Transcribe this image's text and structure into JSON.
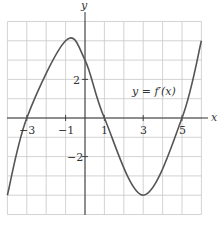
{
  "chart_data": {
    "type": "line",
    "title": "",
    "xlabel": "x",
    "ylabel": "y",
    "xlim": [
      -4,
      6
    ],
    "ylim": [
      -5,
      5
    ],
    "grid": true,
    "x_ticks": [
      -3,
      -1,
      1,
      3,
      5
    ],
    "x_tick_labels": [
      "−3",
      "−1",
      "1",
      "3",
      "5"
    ],
    "y_ticks": [
      2,
      -2
    ],
    "y_tick_labels": [
      "2",
      "−2"
    ],
    "series": [
      {
        "name": "y = f′(x)",
        "points": [
          [
            -4,
            -4
          ],
          [
            -3,
            0
          ],
          [
            -1,
            4
          ],
          [
            0,
            3
          ],
          [
            1,
            0
          ],
          [
            3,
            -4
          ],
          [
            5,
            0
          ],
          [
            6,
            4
          ]
        ]
      }
    ],
    "annotations": [
      {
        "text": "y = f′(x)",
        "x": 2.5,
        "y": 1.35
      }
    ]
  },
  "labels": {
    "x_axis": "x",
    "y_axis": "y",
    "curve_label": "y = f′(x)",
    "xt0": "−3",
    "xt1": "−1",
    "xt2": "1",
    "xt3": "3",
    "xt4": "5",
    "yt0": "2",
    "yt1": "−2"
  }
}
